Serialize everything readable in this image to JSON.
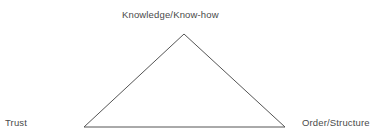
{
  "diagram": {
    "type": "triangle-model",
    "background_color": "#ffffff",
    "stroke_color": "#555555",
    "stroke_width": 1,
    "text_color": "#4a4a4a",
    "vertices": [
      {
        "id": "apex",
        "label": "Knowledge/Know-how",
        "x": 184,
        "y": 34
      },
      {
        "id": "bottom-left",
        "label": "Trust",
        "x": 84,
        "y": 127
      },
      {
        "id": "bottom-right",
        "label": "Order/Structure",
        "x": 285,
        "y": 127
      }
    ],
    "edges": [
      {
        "from": "bottom-left",
        "to": "apex"
      },
      {
        "from": "apex",
        "to": "bottom-right"
      },
      {
        "from": "bottom-right",
        "to": "bottom-left"
      }
    ]
  }
}
